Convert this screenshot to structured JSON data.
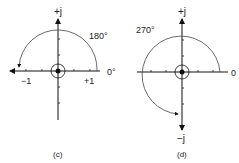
{
  "panels": [
    {
      "id": "c",
      "caption": "(c)",
      "labels": {
        "top": "+j",
        "angle": "180°",
        "right": "0°",
        "neg": "−1",
        "pos": "+1"
      }
    },
    {
      "id": "d",
      "caption": "(d)",
      "labels": {
        "top": "+j",
        "angle": "270°",
        "right": "0",
        "bottom": "−j"
      }
    }
  ]
}
